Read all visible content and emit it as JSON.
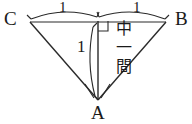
{
  "figure": {
    "type": "geometry-diagram",
    "background_color": "#ffffff",
    "stroke_color": "#2a2a2a",
    "text_color": "#1a1a1a",
    "width": 192,
    "height": 124,
    "vertices": [
      {
        "id": "C",
        "label": "C",
        "x": 30,
        "y": 22
      },
      {
        "id": "B",
        "label": "B",
        "x": 166,
        "y": 22
      },
      {
        "id": "A",
        "label": "A",
        "x": 98,
        "y": 100
      },
      {
        "id": "M",
        "label": "",
        "x": 98,
        "y": 22
      }
    ],
    "segments": [
      {
        "from": "C",
        "to": "B",
        "kind": "horizontal-baseline"
      },
      {
        "from": "C",
        "to": "A",
        "kind": "side"
      },
      {
        "from": "B",
        "to": "A",
        "kind": "side"
      },
      {
        "from": "M",
        "to": "A",
        "kind": "vertical-altitude"
      }
    ],
    "right_angle": {
      "at": "M",
      "marker": "square",
      "side": "right-below"
    },
    "measure_arcs": [
      {
        "id": "arc-cm",
        "spans": "C-M",
        "label": "1",
        "position": "above"
      },
      {
        "id": "arc-mb",
        "spans": "M-B",
        "label": "1",
        "position": "above"
      },
      {
        "id": "arc-ma",
        "spans": "M-A",
        "label": "1",
        "position": "left"
      }
    ],
    "angle_marks": {
      "at": "A",
      "count": 2,
      "description": "two small arcs at vertex A"
    }
  },
  "labels": {
    "vertex_c": "C",
    "vertex_b": "B",
    "vertex_a": "A",
    "length_left": "1",
    "length_right": "1",
    "length_vertical": "1"
  },
  "annotation": {
    "name": "chuukan-label",
    "reading": "chuukan",
    "lines": [
      "中",
      "一",
      "間"
    ],
    "full_text": "中一間"
  }
}
